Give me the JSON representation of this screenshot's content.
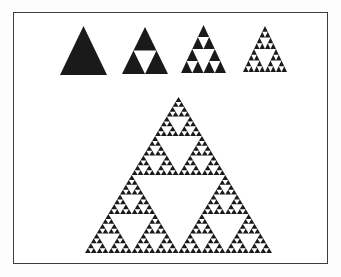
{
  "figure": {
    "title": "",
    "background_color": "#ffffff",
    "frame_color": "#3d3d3d",
    "triangle_fill_color": "#1a1a1a",
    "hole_color": "#ffffff",
    "top_row_stages": [
      {
        "name": "sierpinski-stage-0",
        "iterations": 0
      },
      {
        "name": "sierpinski-stage-1",
        "iterations": 1
      },
      {
        "name": "sierpinski-stage-2",
        "iterations": 2
      },
      {
        "name": "sierpinski-stage-3",
        "iterations": 3
      }
    ],
    "main_triangle": {
      "name": "sierpinski-main",
      "iterations": 5
    }
  }
}
